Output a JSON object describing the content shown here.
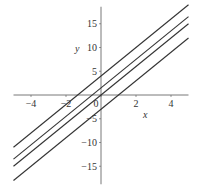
{
  "chart_data": {
    "type": "line",
    "title": "",
    "xlabel": "x",
    "ylabel": "y",
    "xlim": [
      -5,
      5
    ],
    "ylim": [
      -19,
      19
    ],
    "x_ticks": [
      -4,
      -2,
      0,
      2,
      4
    ],
    "y_ticks": [
      -15,
      -10,
      -5,
      5,
      10,
      15
    ],
    "grid": false,
    "legend": null,
    "series": [
      {
        "name": "y = 3x + 4",
        "slope": 3,
        "intercept": 4,
        "x": [
          -5,
          5
        ],
        "y": [
          -11,
          19
        ]
      },
      {
        "name": "y = 3x + 1.5",
        "slope": 3,
        "intercept": 1.5,
        "x": [
          -5,
          5
        ],
        "y": [
          -13.5,
          16.5
        ]
      },
      {
        "name": "y = 3x",
        "slope": 3,
        "intercept": 0,
        "x": [
          -5,
          5
        ],
        "y": [
          -15,
          15
        ]
      },
      {
        "name": "y = 3x - 3",
        "slope": 3,
        "intercept": -3,
        "x": [
          -5,
          5
        ],
        "y": [
          -18,
          12
        ]
      }
    ],
    "line_color": "#333333"
  }
}
